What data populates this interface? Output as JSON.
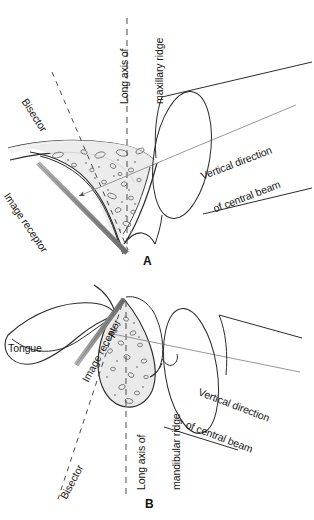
{
  "figure": {
    "panels": [
      {
        "letter": "A",
        "region": "maxillary",
        "labels": {
          "long_axis_line1": "Long axis of",
          "long_axis_line2": "maxillary ridge",
          "bisector": "Bisector",
          "image_receptor": "Image receptor",
          "beam_line1": "Vertical direction",
          "beam_line2": "of central beam"
        }
      },
      {
        "letter": "B",
        "region": "mandibular",
        "labels": {
          "tongue": "Tongue",
          "image_receptor": "Image receptor",
          "long_axis_line1": "Long axis of",
          "long_axis_line2": "mandibular ridge",
          "bisector": "Bisector",
          "beam_line1": "Vertical direction",
          "beam_line2": "of central beam"
        }
      }
    ],
    "colors": {
      "background": "#ffffff",
      "ink": "#1a1a1a",
      "line": "#2b2b2b",
      "thin_line": "#7a7a7a",
      "bone_fill": "#ebebeb",
      "soft_tissue_fill": "#f2f2f2",
      "receptor_fill": "#9a9a9a",
      "receptor_edge": "#5c5c5c",
      "dashed": "#555555"
    }
  }
}
